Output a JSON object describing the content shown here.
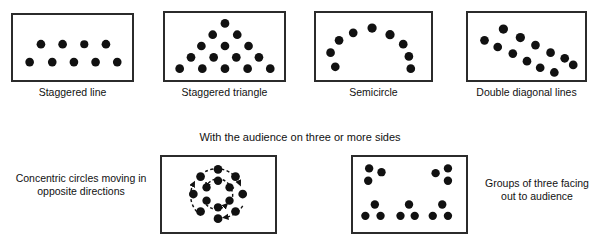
{
  "figure": {
    "background": "#ffffff",
    "dot_color": "#111111",
    "border_color": "#2b2b2b"
  },
  "section_titles": {
    "three_or_more_sides": "With the audience on three or more sides"
  },
  "captions": {
    "staggered_line": "Staggered line",
    "staggered_triangle": "Staggered triangle",
    "semicircle": "Semicircle",
    "double_diagonal_lines": "Double diagonal lines",
    "concentric_circles": "Concentric circles moving in opposite directions",
    "groups_of_three": "Groups of three facing out to audience"
  },
  "panels": [
    {
      "id": "staggered-line",
      "caption": "Staggered line",
      "dot_count": 9,
      "dots": [
        {
          "x": 22,
          "y": 48
        },
        {
          "x": 44,
          "y": 48
        },
        {
          "x": 66,
          "y": 48
        },
        {
          "x": 88,
          "y": 48
        },
        {
          "x": 110,
          "y": 48
        },
        {
          "x": 33,
          "y": 32
        },
        {
          "x": 55,
          "y": 32
        },
        {
          "x": 77,
          "y": 32
        },
        {
          "x": 99,
          "y": 32
        }
      ]
    },
    {
      "id": "staggered-triangle",
      "caption": "Staggered triangle",
      "dot_count": 15,
      "dots": [
        {
          "x": 61,
          "y": 14
        },
        {
          "x": 48,
          "y": 26
        },
        {
          "x": 74,
          "y": 26
        },
        {
          "x": 35,
          "y": 38
        },
        {
          "x": 61,
          "y": 38
        },
        {
          "x": 87,
          "y": 38
        },
        {
          "x": 22,
          "y": 49
        },
        {
          "x": 48,
          "y": 49
        },
        {
          "x": 74,
          "y": 49
        },
        {
          "x": 100,
          "y": 49
        },
        {
          "x": 11,
          "y": 60
        },
        {
          "x": 35,
          "y": 60
        },
        {
          "x": 61,
          "y": 60
        },
        {
          "x": 87,
          "y": 60
        },
        {
          "x": 110,
          "y": 60
        }
      ]
    },
    {
      "id": "semicircle",
      "caption": "Semicircle",
      "dot_count": 9,
      "dots": [
        {
          "x": 15,
          "y": 57
        },
        {
          "x": 12,
          "y": 43
        },
        {
          "x": 20,
          "y": 30
        },
        {
          "x": 34,
          "y": 21
        },
        {
          "x": 52,
          "y": 17
        },
        {
          "x": 70,
          "y": 22
        },
        {
          "x": 84,
          "y": 31
        },
        {
          "x": 91,
          "y": 44
        },
        {
          "x": 92,
          "y": 57
        }
      ]
    },
    {
      "id": "double-diagonal-lines",
      "caption": "Double diagonal lines",
      "dot_count": 12,
      "lines": [
        {
          "name": "upper-line",
          "dots": [
            {
              "x": 14,
              "y": 28
            },
            {
              "x": 34,
              "y": 17
            },
            {
              "x": 52,
              "y": 25
            },
            {
              "x": 67,
              "y": 33
            },
            {
              "x": 82,
              "y": 41
            },
            {
              "x": 98,
              "y": 48
            }
          ]
        },
        {
          "name": "lower-line",
          "dots": [
            {
              "x": 28,
              "y": 35
            },
            {
              "x": 44,
              "y": 41
            },
            {
              "x": 58,
              "y": 49
            },
            {
              "x": 72,
              "y": 56
            },
            {
              "x": 86,
              "y": 61
            },
            {
              "x": 104,
              "y": 54
            }
          ]
        }
      ]
    },
    {
      "id": "concentric-circles",
      "caption": "Concentric circles moving in opposite directions",
      "outer_dot_count": 8,
      "inner_dot_count": 6,
      "outer_radius": 26,
      "inner_radius": 14,
      "center": {
        "x": 58,
        "y": 39
      },
      "arrows": {
        "outer_direction": "clockwise",
        "inner_direction": "counter-clockwise",
        "style": "dashed"
      }
    },
    {
      "id": "groups-of-three",
      "caption": "Groups of three facing out to audience",
      "group_count": 5,
      "dots_per_group": 3,
      "groups": [
        {
          "name": "top-left",
          "cx": 22,
          "cy": 18
        },
        {
          "name": "top-right",
          "cx": 93,
          "cy": 18
        },
        {
          "name": "bottom-left",
          "cx": 22,
          "cy": 58
        },
        {
          "name": "bottom-center",
          "cx": 58,
          "cy": 58
        },
        {
          "name": "bottom-right",
          "cx": 93,
          "cy": 58
        }
      ]
    }
  ]
}
